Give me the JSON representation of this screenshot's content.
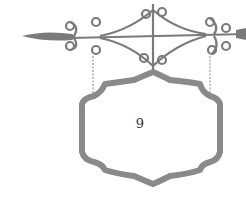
{
  "sign": {
    "label": "9",
    "stroke_color": "#8a8a8a",
    "iron_color": "#7a7a7a"
  }
}
